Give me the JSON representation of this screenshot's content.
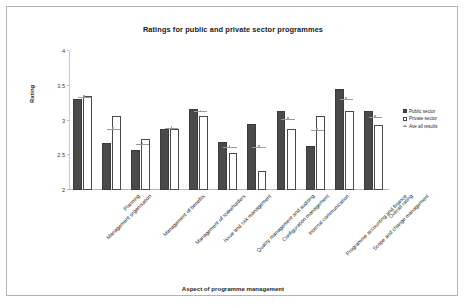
{
  "chart_data": {
    "type": "bar",
    "title": "Ratings for public and private sector programmes",
    "xlabel": "Aspect of programme management",
    "ylabel": "Rating",
    "ylim": [
      2,
      4
    ],
    "yticks": [
      "2",
      "2.5",
      "3",
      "3.5",
      "4"
    ],
    "grid": false,
    "legend_position": "right",
    "categories": [
      "Management organisation",
      "Planning",
      "Management of benefits",
      "Management of stakeholders",
      "Issue and risk management",
      "Quality management and auditing",
      "Configuration management",
      "Internal communication",
      "Programme accounting and finance",
      "Scope and change management",
      "Overall rating"
    ],
    "series": [
      {
        "name": "Public sector",
        "type": "bar",
        "color": "#4a4a4a",
        "values": [
          3.31,
          2.67,
          2.57,
          2.88,
          3.16,
          2.69,
          2.95,
          3.14,
          2.64,
          3.46,
          3.13
        ]
      },
      {
        "name": "Private sector",
        "type": "bar",
        "color": "#ffffff",
        "values": [
          3.35,
          3.07,
          2.73,
          2.88,
          3.07,
          2.53,
          2.27,
          2.88,
          3.06,
          3.14,
          2.94
        ]
      },
      {
        "name": "Ave all results",
        "type": "line-marker",
        "color": "#9b9b9b",
        "values": [
          3.33,
          2.87,
          2.65,
          2.88,
          3.12,
          2.61,
          2.61,
          3.01,
          2.85,
          3.3,
          3.04
        ]
      }
    ]
  },
  "legend": {
    "items": [
      {
        "label": "Public sector"
      },
      {
        "label": "Private sector"
      },
      {
        "label": "Ave all results"
      }
    ]
  }
}
